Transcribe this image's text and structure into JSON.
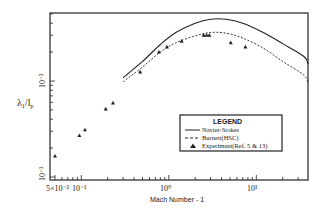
{
  "chart_data": {
    "type": "line",
    "title": "",
    "xlabel": "Mach Number - 1",
    "ylabel": "λ1/l_p",
    "xscale": "log",
    "yscale": "log",
    "xlim": [
      0.05,
      50
    ],
    "ylim": [
      0.001,
      0.05
    ],
    "x_tick_labels": [
      "5×10⁻²",
      "10⁻¹",
      "10⁰",
      "10¹"
    ],
    "x_tick_values": [
      0.05,
      0.1,
      1,
      10
    ],
    "y_tick_labels": [
      "10⁻³",
      "10⁻²"
    ],
    "y_tick_values": [
      0.001,
      0.01
    ],
    "grid": false,
    "legend": {
      "title": "LEGEND",
      "position": "lower right",
      "entries": [
        {
          "label": "Navier-Stokes",
          "style": "solid"
        },
        {
          "label": "Burnett(HSC)",
          "style": "dashed"
        },
        {
          "label": "Experiment(Ref. 5 & 13)",
          "style": "triangle-marker"
        }
      ]
    },
    "series": [
      {
        "name": "Navier-Stokes",
        "style": "solid",
        "x": [
          0.3,
          0.5,
          0.8,
          1.2,
          2.0,
          3.0,
          4.5,
          7.0,
          12,
          20,
          35,
          50
        ],
        "y": [
          0.0108,
          0.016,
          0.024,
          0.032,
          0.04,
          0.044,
          0.044,
          0.04,
          0.032,
          0.0245,
          0.018,
          0.015
        ]
      },
      {
        "name": "Burnett(HSC)",
        "style": "dashed",
        "x": [
          0.3,
          0.5,
          0.8,
          1.2,
          2.0,
          3.0,
          4.5,
          7.0,
          12,
          20,
          35,
          50
        ],
        "y": [
          0.0098,
          0.014,
          0.02,
          0.025,
          0.0295,
          0.032,
          0.0315,
          0.028,
          0.022,
          0.016,
          0.0115,
          0.0095
        ]
      },
      {
        "name": "Experiment(Ref. 5 & 13)",
        "style": "markers",
        "marker": "triangle",
        "x": [
          0.05,
          0.095,
          0.11,
          0.19,
          0.23,
          0.47,
          0.77,
          0.95,
          1.4,
          2.5,
          2.7,
          2.9,
          5.1,
          7.5
        ],
        "y": [
          0.00165,
          0.0027,
          0.0031,
          0.0051,
          0.0059,
          0.0124,
          0.02,
          0.0226,
          0.026,
          0.03,
          0.03,
          0.03,
          0.025,
          0.0226
        ]
      }
    ]
  },
  "labels": {
    "xlabel": "Mach Number - 1",
    "ylabel_main": "λ",
    "ylabel_sub1": "1",
    "ylabel_slash": "/l",
    "ylabel_sub2": "p",
    "legend_title": "LEGEND",
    "legend_ns": "Navier-Stokes",
    "legend_burnett": "Burnett(HSC)",
    "legend_exp": "Experiment(Ref. 5 & 13)",
    "xtick_0": "5×10⁻²",
    "xtick_1": "10⁻¹",
    "xtick_2": "10⁰",
    "xtick_3": "10¹",
    "ytick_0": "10⁻³",
    "ytick_1": "10⁻²"
  }
}
